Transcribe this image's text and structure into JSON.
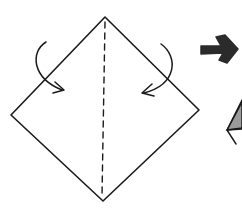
{
  "diagram": {
    "type": "origami-instruction",
    "step_current": {
      "shape": "square-on-point",
      "vertices": {
        "top": [
          105,
          17
        ],
        "right": [
          199,
          110
        ],
        "bottom": [
          103,
          201
        ],
        "left": [
          11,
          115
        ]
      },
      "fold_line": {
        "style": "dashed",
        "kind": "valley-fold",
        "from": [
          105,
          20
        ],
        "to": [
          102,
          197
        ]
      },
      "fold_arrows": [
        {
          "name": "left-fold-arrow",
          "direction": "clockwise-inward"
        },
        {
          "name": "right-fold-arrow",
          "direction": "counterclockwise-inward"
        }
      ]
    },
    "next_step_arrow": {
      "direction": "right",
      "style": "bold"
    },
    "step_next": {
      "partially_visible": true,
      "fill_color": "#9a9a9a"
    },
    "colors": {
      "line": "#1a1a1a",
      "background": "#ffffff",
      "arrow_fill": "#2b2b2b",
      "shade": "#9a9a9a"
    }
  }
}
